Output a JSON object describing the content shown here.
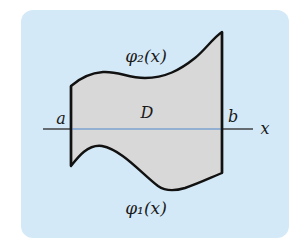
{
  "diagram": {
    "region_label": "D",
    "upper_curve_label": "φ₂(x)",
    "lower_curve_label": "φ₁(x)",
    "left_bound_label": "a",
    "right_bound_label": "b",
    "axis_label": "x",
    "colors": {
      "panel": "#d4e9f7",
      "region_fill": "#d8d8d8",
      "outline": "#111111",
      "axis_inside": "#4f86c9",
      "axis_outside": "#1a1a1a"
    }
  }
}
